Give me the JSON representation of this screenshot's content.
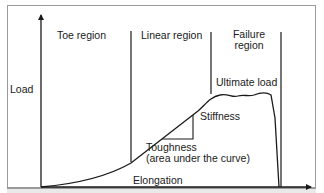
{
  "diagram": {
    "axes": {
      "y_label": "Load",
      "x_label": "Elongation"
    },
    "regions": [
      {
        "label": "Toe region"
      },
      {
        "label": "Linear region"
      },
      {
        "label": "Failure region",
        "lines": [
          "Failure",
          "region"
        ]
      }
    ],
    "annotations": {
      "ultimate_load": "Ultimate load",
      "stiffness": "Stiffness",
      "toughness_line1": "Toughness",
      "toughness_line2": "(area under the curve)"
    },
    "colors": {
      "line": "#1a1a1a",
      "frame": "#9a9a9a",
      "background": "#ffffff"
    }
  }
}
